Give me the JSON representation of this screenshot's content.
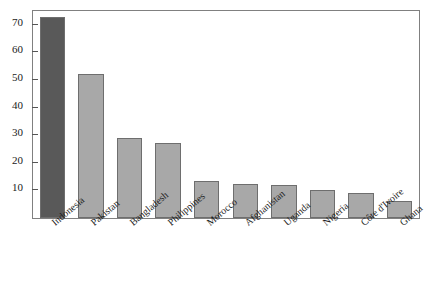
{
  "chart_data": {
    "type": "bar",
    "title": "",
    "subtitle": "",
    "xlabel": "",
    "ylabel": "",
    "categories": [
      "Indonesia",
      "Pakistan",
      "Bangladesh",
      "Philippines",
      "Morocco",
      "Afghanistan",
      "Uganda",
      "Nigeria",
      "Côte d'Ivoire",
      "Ghana"
    ],
    "values": [
      73,
      52,
      29,
      27,
      13.5,
      12.5,
      12,
      10,
      9,
      6
    ],
    "ylim": [
      0,
      75
    ],
    "yticks": [
      10,
      20,
      30,
      40,
      50,
      60,
      70
    ],
    "ytick_labels": [
      "10",
      "20",
      "30",
      "40",
      "50",
      "60",
      "70"
    ],
    "grid": false,
    "legend": null,
    "bar_colors": [
      "#595959",
      "#a8a8a8",
      "#a8a8a8",
      "#a8a8a8",
      "#a8a8a8",
      "#a8a8a8",
      "#a8a8a8",
      "#a8a8a8",
      "#a8a8a8",
      "#a8a8a8"
    ],
    "highlight_color": "#595959",
    "bar_color": "#a8a8a8",
    "bar_edge_color": "#6e6e6e",
    "frame_color": "#808080",
    "background_color": "#ffffff",
    "text_color": "#1a1a1a",
    "x_label_rotation": -40
  }
}
